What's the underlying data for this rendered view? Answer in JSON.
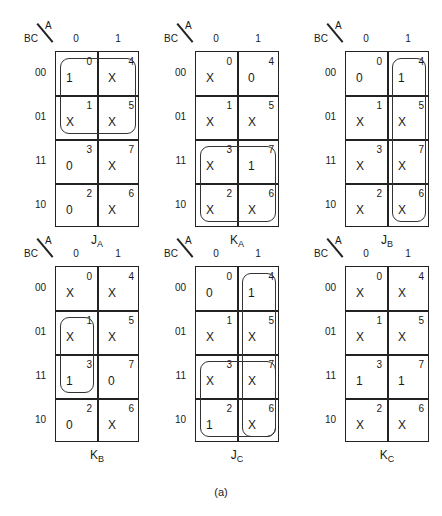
{
  "figure": {
    "caption": "(a)",
    "axis": {
      "row_var": "BC",
      "col_var": "A",
      "col_labels": [
        "0",
        "1"
      ],
      "row_labels": [
        "00",
        "01",
        "11",
        "10"
      ]
    },
    "maps": [
      {
        "name": "J",
        "sub": "A",
        "cells": [
          [
            "1",
            "X"
          ],
          [
            "X",
            "X"
          ],
          [
            "0",
            "X"
          ],
          [
            "0",
            "X"
          ]
        ],
        "indices": [
          [
            "0",
            "4"
          ],
          [
            "1",
            "5"
          ],
          [
            "3",
            "7"
          ],
          [
            "2",
            "6"
          ]
        ],
        "loops": [
          {
            "rows": [
              0,
              1
            ],
            "cols": [
              0,
              1
            ]
          }
        ]
      },
      {
        "name": "K",
        "sub": "A",
        "cells": [
          [
            "X",
            "0"
          ],
          [
            "X",
            "X"
          ],
          [
            "X",
            "1"
          ],
          [
            "X",
            "X"
          ]
        ],
        "indices": [
          [
            "0",
            "4"
          ],
          [
            "1",
            "5"
          ],
          [
            "3",
            "7"
          ],
          [
            "2",
            "6"
          ]
        ],
        "loops": [
          {
            "rows": [
              2,
              3
            ],
            "cols": [
              0,
              1
            ]
          }
        ]
      },
      {
        "name": "J",
        "sub": "B",
        "cells": [
          [
            "0",
            "1"
          ],
          [
            "X",
            "X"
          ],
          [
            "X",
            "X"
          ],
          [
            "X",
            "X"
          ]
        ],
        "indices": [
          [
            "0",
            "4"
          ],
          [
            "1",
            "5"
          ],
          [
            "3",
            "7"
          ],
          [
            "2",
            "6"
          ]
        ],
        "loops": [
          {
            "rows": [
              0,
              3
            ],
            "cols": [
              1,
              1
            ]
          }
        ]
      },
      {
        "name": "K",
        "sub": "B",
        "cells": [
          [
            "X",
            "X"
          ],
          [
            "X",
            "X"
          ],
          [
            "1",
            "0"
          ],
          [
            "0",
            "X"
          ]
        ],
        "indices": [
          [
            "0",
            "4"
          ],
          [
            "1",
            "5"
          ],
          [
            "3",
            "7"
          ],
          [
            "2",
            "6"
          ]
        ],
        "loops": [
          {
            "rows": [
              1,
              2
            ],
            "cols": [
              0,
              0
            ]
          }
        ]
      },
      {
        "name": "J",
        "sub": "C",
        "cells": [
          [
            "0",
            "1"
          ],
          [
            "X",
            "X"
          ],
          [
            "X",
            "X"
          ],
          [
            "1",
            "X"
          ]
        ],
        "indices": [
          [
            "0",
            "4"
          ],
          [
            "1",
            "5"
          ],
          [
            "3",
            "7"
          ],
          [
            "2",
            "6"
          ]
        ],
        "loops": [
          {
            "rows": [
              0,
              3
            ],
            "cols": [
              1,
              1
            ]
          },
          {
            "rows": [
              2,
              3
            ],
            "cols": [
              0,
              1
            ]
          }
        ]
      },
      {
        "name": "K",
        "sub": "C",
        "cells": [
          [
            "X",
            "X"
          ],
          [
            "X",
            "X"
          ],
          [
            "1",
            "1"
          ],
          [
            "X",
            "X"
          ]
        ],
        "indices": [
          [
            "0",
            "4"
          ],
          [
            "1",
            "5"
          ],
          [
            "3",
            "7"
          ],
          [
            "2",
            "6"
          ]
        ],
        "loops": []
      }
    ]
  }
}
